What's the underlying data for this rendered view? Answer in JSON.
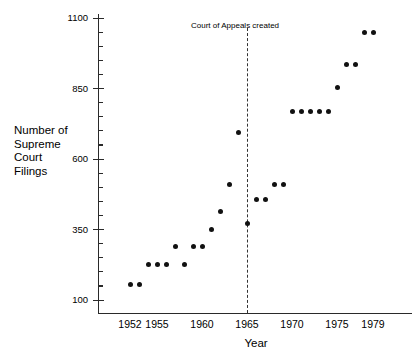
{
  "chart_data": {
    "type": "scatter",
    "title": "",
    "xlabel": "Year",
    "ylabel": "Number of Supreme Court Filings",
    "ylabel_lines": [
      "Number of",
      "Supreme",
      "Court",
      "Filings"
    ],
    "xlim": [
      1951,
      1981
    ],
    "ylim": [
      100,
      1100
    ],
    "grid": false,
    "legend": null,
    "x_tick_labels": [
      "1952",
      "1955",
      "1960",
      "1965",
      "1970",
      "1975",
      "1979"
    ],
    "x_tick_values": [
      1952,
      1955,
      1960,
      1965,
      1970,
      1975,
      1979
    ],
    "y_tick_labels": [
      "100",
      "350",
      "600",
      "850",
      "1100"
    ],
    "y_tick_values": [
      100,
      350,
      600,
      850,
      1100
    ],
    "y_minor_step": 50,
    "annotations": [
      {
        "text": "Court of Appeals created",
        "x": 1965,
        "type": "vertical-dashed-line-label"
      }
    ],
    "series": [
      {
        "name": "Supreme Court Filings",
        "marker": "filled-circle",
        "color": "#111111",
        "x": [
          1952,
          1953,
          1954,
          1955,
          1956,
          1957,
          1958,
          1959,
          1960,
          1961,
          1962,
          1963,
          1964,
          1965,
          1966,
          1967,
          1968,
          1969,
          1970,
          1971,
          1972,
          1973,
          1974,
          1975,
          1976,
          1977,
          1978,
          1979
        ],
        "y": [
          155,
          155,
          225,
          225,
          225,
          290,
          225,
          290,
          290,
          350,
          415,
          510,
          695,
          370,
          455,
          455,
          510,
          510,
          770,
          770,
          770,
          770,
          770,
          853,
          935,
          935,
          1050,
          1050
        ]
      }
    ]
  },
  "axis": {
    "vline_color": "#333333",
    "axis_color": "#2a2a2a",
    "marker_color": "#111111"
  }
}
